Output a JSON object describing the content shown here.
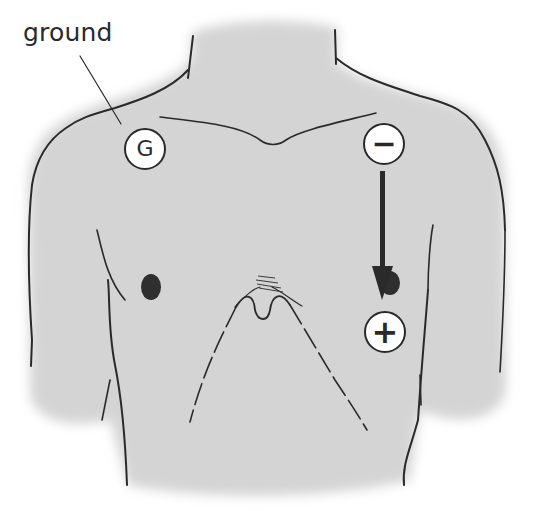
{
  "diagram": {
    "type": "ECG lead placement (chest)",
    "labels": {
      "ground": "ground"
    },
    "electrodes": [
      {
        "id": "ground",
        "symbol": "G",
        "position": "right upper chest (viewer's left)"
      },
      {
        "id": "negative",
        "symbol": "−",
        "position": "left upper chest (viewer's right)"
      },
      {
        "id": "positive",
        "symbol": "+",
        "position": "left lower chest (viewer's right)"
      }
    ],
    "arrow": {
      "from": "negative",
      "to": "positive",
      "direction": "down"
    },
    "colors": {
      "skin_fill": "#d4d4d4",
      "outline": "#2a2a2a",
      "background": "#ffffff",
      "electrode_fill": "#ffffff"
    }
  }
}
